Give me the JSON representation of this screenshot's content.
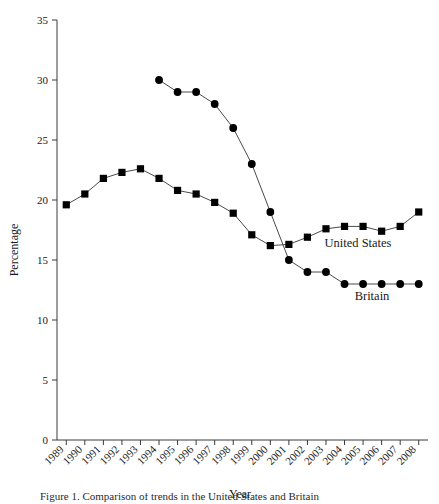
{
  "chart_data": {
    "type": "line",
    "title": "",
    "xlabel": "Year",
    "ylabel": "Percentage",
    "categories": [
      "1989",
      "1990",
      "1991",
      "1992",
      "1993",
      "1994",
      "1995",
      "1996",
      "1997",
      "1998",
      "1999",
      "2000",
      "2001",
      "2002",
      "2003",
      "2004",
      "2005",
      "2006",
      "2007",
      "2008"
    ],
    "x_tick_labels": [
      "1989",
      "1990",
      "1991",
      "1992",
      "1993",
      "1994",
      "1995",
      "1996",
      "1997",
      "1998",
      "1999",
      "2000",
      "2001",
      "2002",
      "2003",
      "2004",
      "2005",
      "2006",
      "2007",
      "2008"
    ],
    "y_tick_labels": [
      "0",
      "5",
      "10",
      "15",
      "20",
      "25",
      "30",
      "35"
    ],
    "y_ticks": [
      0,
      5,
      10,
      15,
      20,
      25,
      30,
      35
    ],
    "ylim": [
      0,
      35
    ],
    "grid": false,
    "legend_position": "inline-right",
    "series": [
      {
        "name": "United States",
        "marker": "square",
        "label_text": "United States",
        "values": [
          19.6,
          20.5,
          21.8,
          22.3,
          22.6,
          21.8,
          20.8,
          20.5,
          19.8,
          18.9,
          17.1,
          16.2,
          16.3,
          16.9,
          17.6,
          17.8,
          17.8,
          17.4,
          17.8,
          19.0
        ]
      },
      {
        "name": "Britain",
        "marker": "circle",
        "label_text": "Britain",
        "values": [
          null,
          null,
          null,
          null,
          null,
          30.0,
          29.0,
          29.0,
          28.0,
          26.0,
          23.0,
          19.0,
          15.0,
          14.0,
          14.0,
          13.0,
          13.0,
          13.0,
          13.0,
          13.0
        ]
      }
    ]
  },
  "caption": {
    "text": "  Figure 1.  Comparison of trends in the United States and Britain"
  }
}
